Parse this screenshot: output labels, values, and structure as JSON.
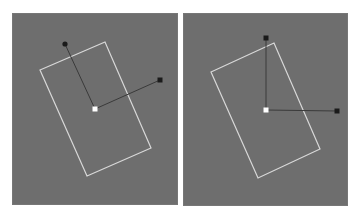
{
  "figure": {
    "colors": {
      "background": "#ffffff",
      "panel": "#6e6e6e",
      "rectangle_outline": "#d8d8d8",
      "axis_line": "#3a3a3a",
      "handle": "#1a1a1a",
      "pivot": "#ffffff"
    },
    "panels": [
      {
        "id": "left",
        "label": "local-axes-view",
        "box": {
          "x": 12,
          "y": 13,
          "w": 166,
          "h": 192
        },
        "rectangle": [
          [
            28,
            57
          ],
          [
            93,
            29
          ],
          [
            139,
            135
          ],
          [
            75,
            163
          ]
        ],
        "pivot": [
          83,
          96
        ],
        "handles": [
          {
            "name": "y-axis-handle",
            "pos": [
              53,
              31
            ]
          },
          {
            "name": "x-axis-handle",
            "pos": [
              148,
              67
            ]
          }
        ]
      },
      {
        "id": "right",
        "label": "world-axes-view",
        "box": {
          "x": 183,
          "y": 13,
          "w": 165,
          "h": 193
        },
        "rectangle": [
          [
            28,
            59
          ],
          [
            91,
            30
          ],
          [
            137,
            136
          ],
          [
            75,
            165
          ]
        ],
        "pivot": [
          83,
          97
        ],
        "handles": [
          {
            "name": "y-axis-handle",
            "pos": [
              83,
              25
            ]
          },
          {
            "name": "x-axis-handle",
            "pos": [
              154,
              98
            ]
          }
        ]
      }
    ]
  }
}
